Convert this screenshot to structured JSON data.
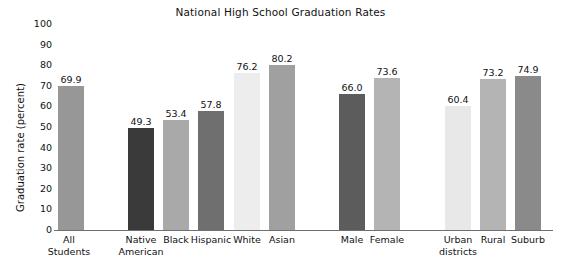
{
  "chart_data": {
    "type": "bar",
    "title": "National High School Graduation Rates",
    "xlabel": "",
    "ylabel": "Graduation rate (percent)",
    "ylim": [
      0,
      100
    ],
    "yticks": [
      0,
      10,
      20,
      30,
      40,
      50,
      60,
      70,
      80,
      90,
      100
    ],
    "grid": false,
    "legend": "none",
    "categories": [
      "All\nStudents",
      "Native\nAmerican",
      "Black",
      "Hispanic",
      "White",
      "Asian",
      "Male",
      "Female",
      "Urban\ndistricts",
      "Rural",
      "Suburb"
    ],
    "values": [
      69.9,
      49.3,
      53.4,
      57.8,
      76.2,
      80.2,
      66.0,
      73.6,
      60.4,
      73.2,
      74.9
    ],
    "value_labels": [
      "69.9",
      "49.3",
      "53.4",
      "57.8",
      "76.2",
      "80.2",
      "66.0",
      "73.6",
      "60.4",
      "73.2",
      "74.9"
    ],
    "bar_colors": [
      "#979797",
      "#3a3a3a",
      "#a9a9a9",
      "#6f6f6f",
      "#ededed",
      "#a0a0a0",
      "#5c5c5c",
      "#b4b4b4",
      "#e8e8e8",
      "#b4b4b4",
      "#8a8a8a"
    ],
    "groups": [
      {
        "name": "overall",
        "members": [
          "All Students"
        ]
      },
      {
        "name": "race-ethnicity",
        "members": [
          "Native American",
          "Black",
          "Hispanic",
          "White",
          "Asian"
        ]
      },
      {
        "name": "gender",
        "members": [
          "Male",
          "Female"
        ]
      },
      {
        "name": "locale",
        "members": [
          "Urban districts",
          "Rural",
          "Suburb"
        ]
      }
    ],
    "axis_color": "#6f6f6f",
    "background": "#ffffff"
  },
  "layout": {
    "bar_positions": [
      {
        "left": 2,
        "width": 26
      },
      {
        "left": 72,
        "width": 26
      },
      {
        "left": 107,
        "width": 26
      },
      {
        "left": 142,
        "width": 26
      },
      {
        "left": 178,
        "width": 26
      },
      {
        "left": 213,
        "width": 26
      },
      {
        "left": 283,
        "width": 26
      },
      {
        "left": 318,
        "width": 26
      },
      {
        "left": 389,
        "width": 26
      },
      {
        "left": 424,
        "width": 26
      },
      {
        "left": 459,
        "width": 26
      }
    ],
    "label_positions": [
      {
        "left": -14,
        "width": 54
      },
      {
        "left": 56,
        "width": 58
      },
      {
        "left": 93,
        "width": 54
      },
      {
        "left": 126,
        "width": 58
      },
      {
        "left": 164,
        "width": 54
      },
      {
        "left": 198,
        "width": 56
      },
      {
        "left": 269,
        "width": 54
      },
      {
        "left": 300,
        "width": 62
      },
      {
        "left": 373,
        "width": 58
      },
      {
        "left": 410,
        "width": 54
      },
      {
        "left": 445,
        "width": 54
      }
    ]
  }
}
